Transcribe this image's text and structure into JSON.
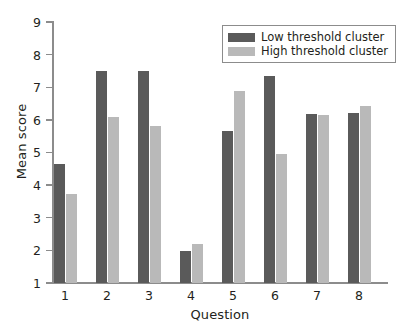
{
  "chart_data": {
    "type": "bar",
    "title": "",
    "xlabel": "Question",
    "ylabel": "Mean score",
    "categories": [
      "1",
      "2",
      "3",
      "4",
      "5",
      "6",
      "7",
      "8"
    ],
    "series": [
      {
        "name": "Low threshold cluster",
        "color": "#5a5a5a",
        "values": [
          4.65,
          7.5,
          7.5,
          1.98,
          5.65,
          7.33,
          6.18,
          6.21
        ]
      },
      {
        "name": "High threshold cluster",
        "color": "#b9b9b9",
        "values": [
          3.72,
          6.08,
          5.8,
          2.21,
          6.89,
          4.95,
          6.15,
          6.43
        ]
      }
    ],
    "ylim": [
      1,
      9
    ],
    "yticks": [
      "1",
      "2",
      "3",
      "4",
      "5",
      "6",
      "7",
      "8",
      "9"
    ],
    "grid": false,
    "legend_position": "top-right"
  },
  "legend": {
    "entries": [
      {
        "label": "Low threshold cluster",
        "swatch": "low"
      },
      {
        "label": "High threshold cluster",
        "swatch": "high"
      }
    ]
  }
}
